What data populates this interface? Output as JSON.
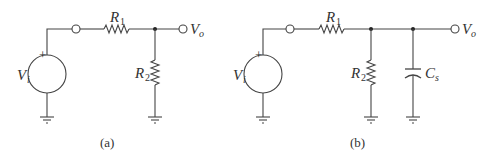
{
  "diagrams": [
    {
      "id": "a",
      "caption": "(a)",
      "source": {
        "main": "V",
        "sub": "i",
        "polarity": "+"
      },
      "r1": {
        "main": "R",
        "sub": "1"
      },
      "r2": {
        "main": "R",
        "sub": "2"
      },
      "output": {
        "main": "V",
        "sub": "o"
      }
    },
    {
      "id": "b",
      "caption": "(b)",
      "source": {
        "main": "V",
        "sub": "i",
        "polarity": "+"
      },
      "r1": {
        "main": "R",
        "sub": "1"
      },
      "r2": {
        "main": "R",
        "sub": "2"
      },
      "cap": {
        "main": "C",
        "sub": "s"
      },
      "output": {
        "main": "V",
        "sub": "o"
      }
    }
  ],
  "colors": {
    "line": "#444444",
    "text": "#333333",
    "background": "#ffffff"
  }
}
